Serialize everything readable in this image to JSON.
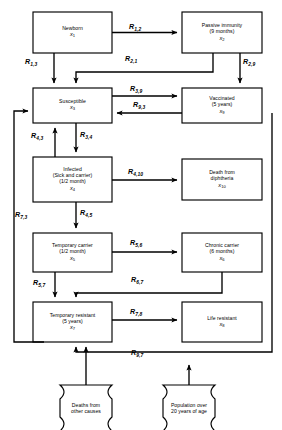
{
  "diagram": {
    "type": "state-transition-flow-diagram",
    "line_color": "#000000",
    "fill_color": "#ffffff",
    "nodes": [
      {
        "id": "x1",
        "shape": "rect",
        "lines": [
          "Newborn"
        ],
        "variable": "x",
        "sub": "1"
      },
      {
        "id": "x2",
        "shape": "rect",
        "lines": [
          "Passive immunity",
          "(9 months)"
        ],
        "variable": "x",
        "sub": "2"
      },
      {
        "id": "x3",
        "shape": "rect",
        "lines": [
          "Susceptible"
        ],
        "variable": "x",
        "sub": "3"
      },
      {
        "id": "x9",
        "shape": "rect",
        "lines": [
          "Vaccinated",
          "(5 years)"
        ],
        "variable": "x",
        "sub": "9"
      },
      {
        "id": "x4",
        "shape": "rect",
        "lines": [
          "Infected",
          "(Sick and carrier)",
          "(1/2 month)"
        ],
        "variable": "x",
        "sub": "4"
      },
      {
        "id": "x10",
        "shape": "rect",
        "lines": [
          "Death from",
          "diphtheria"
        ],
        "variable": "x",
        "sub": "10"
      },
      {
        "id": "x5",
        "shape": "rect",
        "lines": [
          "Temporary carrier",
          "(1/2 month)"
        ],
        "variable": "x",
        "sub": "5"
      },
      {
        "id": "x6",
        "shape": "rect",
        "lines": [
          "Chronic carrier",
          "(6 months)"
        ],
        "variable": "x",
        "sub": "6"
      },
      {
        "id": "x7",
        "shape": "rect",
        "lines": [
          "Temporary resistant",
          "(5 years)"
        ],
        "variable": "x",
        "sub": "7"
      },
      {
        "id": "x8",
        "shape": "rect",
        "lines": [
          "Life resistant"
        ],
        "variable": "x",
        "sub": "8"
      },
      {
        "id": "d1",
        "shape": "capsule",
        "lines": [
          "Deaths from",
          "other causes"
        ],
        "variable": "",
        "sub": ""
      },
      {
        "id": "d2",
        "shape": "capsule",
        "lines": [
          "Population over",
          "20 years of age"
        ],
        "variable": "",
        "sub": ""
      }
    ],
    "edges": [
      {
        "id": "R1_2",
        "from": "x1",
        "to": "x2",
        "label": "R",
        "sub": "1,2"
      },
      {
        "id": "R1_3",
        "from": "x1",
        "to": "x3",
        "label": "R",
        "sub": "1,3"
      },
      {
        "id": "R2_1",
        "from": "x2",
        "to": "x3",
        "label": "R",
        "sub": "2,1"
      },
      {
        "id": "R2_9",
        "from": "x2",
        "to": "x9",
        "label": "R",
        "sub": "2,9"
      },
      {
        "id": "R3_9",
        "from": "x3",
        "to": "x9",
        "label": "R",
        "sub": "3,9"
      },
      {
        "id": "R9_3",
        "from": "x9",
        "to": "x3",
        "label": "R",
        "sub": "9,3"
      },
      {
        "id": "R3_4",
        "from": "x3",
        "to": "x4",
        "label": "R",
        "sub": "3,4"
      },
      {
        "id": "R4_3",
        "from": "x4",
        "to": "x3",
        "label": "R",
        "sub": "4,3"
      },
      {
        "id": "R4_10",
        "from": "x4",
        "to": "x10",
        "label": "R",
        "sub": "4,10"
      },
      {
        "id": "R4_5",
        "from": "x4",
        "to": "x5",
        "label": "R",
        "sub": "4,5"
      },
      {
        "id": "R5_6",
        "from": "x5",
        "to": "x6",
        "label": "R",
        "sub": "5,6"
      },
      {
        "id": "R5_7",
        "from": "x5",
        "to": "x7",
        "label": "R",
        "sub": "5,7"
      },
      {
        "id": "R6_7",
        "from": "x6",
        "to": "x7",
        "label": "R",
        "sub": "6,7"
      },
      {
        "id": "R7_8",
        "from": "x7",
        "to": "x8",
        "label": "R",
        "sub": "7,8"
      },
      {
        "id": "R7_3",
        "from": "x7",
        "to": "x3",
        "label": "R",
        "sub": "7,3"
      },
      {
        "id": "R9_7",
        "from": "x9",
        "to": "x7",
        "label": "R",
        "sub": "9,7"
      }
    ]
  }
}
